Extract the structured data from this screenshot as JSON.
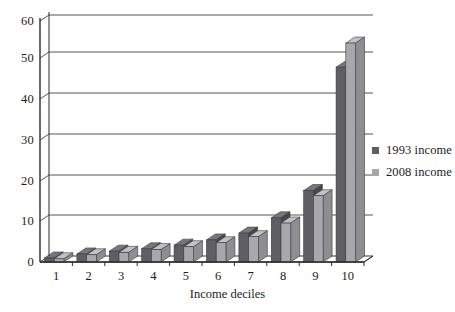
{
  "chart_data": {
    "type": "bar",
    "title": "",
    "subtitle": "",
    "xlabel": "Income deciles",
    "ylabel": "",
    "categories": [
      "1",
      "2",
      "3",
      "4",
      "5",
      "6",
      "7",
      "8",
      "9",
      "10"
    ],
    "series": [
      {
        "name": "1993 income",
        "color": "#5e5e64",
        "values": [
          1.0,
          2.0,
          2.7,
          3.3,
          4.2,
          5.5,
          7.2,
          11.0,
          17.8,
          48.5
        ]
      },
      {
        "name": "2008 income",
        "color": "#a8a8ac",
        "values": [
          0.8,
          1.8,
          2.4,
          3.1,
          3.8,
          4.8,
          6.3,
          9.7,
          16.5,
          54.5
        ]
      }
    ],
    "yticks": [
      0,
      10,
      20,
      30,
      40,
      50,
      60
    ],
    "ylim": [
      0,
      60
    ],
    "grid": true,
    "legend_position": "right",
    "style": "3d-perspective-column"
  },
  "legend": {
    "items": [
      {
        "label": "1993 income",
        "color": "#5e5e64"
      },
      {
        "label": "2008 income",
        "color": "#a8a8ac"
      }
    ]
  },
  "axes": {
    "x_title": "Income deciles",
    "y_tick_labels": [
      "60",
      "50",
      "40",
      "30",
      "20",
      "10",
      "0"
    ],
    "x_tick_labels": [
      "1",
      "2",
      "3",
      "4",
      "5",
      "6",
      "7",
      "8",
      "9",
      "10"
    ]
  },
  "colors": {
    "series_1993": "#5e5e64",
    "series_1993_side": "#46464b",
    "series_1993_top": "#76767c",
    "series_2008": "#a8a8ac",
    "series_2008_side": "#8d8d92",
    "series_2008_top": "#c2c2c6",
    "axis": "#2b2b2b",
    "grid": "#5a5a5a",
    "background": "#ffffff"
  }
}
